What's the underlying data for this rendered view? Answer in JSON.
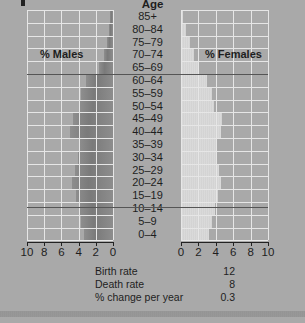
{
  "chart_data": {
    "type": "bar",
    "subtype": "population-pyramid",
    "title": "Age",
    "categories": [
      "85+",
      "80–84",
      "75–79",
      "70–74",
      "65–69",
      "60–64",
      "55–59",
      "50–54",
      "45–49",
      "40–44",
      "35–39",
      "30–34",
      "25–29",
      "20–24",
      "15–19",
      "10–14",
      "5–9",
      "0–4"
    ],
    "series": [
      {
        "name": "% Males",
        "values": [
          0.35,
          0.5,
          0.7,
          1.0,
          1.6,
          3.1,
          3.7,
          3.8,
          4.7,
          5.0,
          4.0,
          4.1,
          4.4,
          4.8,
          4.3,
          4.0,
          3.7,
          3.4
        ]
      },
      {
        "name": "% Females",
        "values": [
          0.25,
          0.6,
          1.0,
          1.5,
          2.1,
          3.0,
          3.6,
          3.8,
          4.7,
          4.6,
          4.1,
          4.1,
          4.4,
          4.6,
          4.2,
          3.9,
          3.6,
          3.2
        ]
      }
    ],
    "xlabel_left": "% Males",
    "xlabel_right": "% Females",
    "ylabel": "Age",
    "xlim": [
      0,
      10
    ],
    "xticks_left": [
      "10",
      "8",
      "6",
      "4",
      "2",
      "0"
    ],
    "xticks_right": [
      "0",
      "2",
      "4",
      "6",
      "8",
      "10"
    ],
    "grid": true,
    "reference_lines_between": [
      [
        "65–69",
        "60–64"
      ],
      [
        "15–19",
        "10–14"
      ]
    ],
    "annotations": [
      {
        "label": "Birth rate",
        "value": "12"
      },
      {
        "label": "Death rate",
        "value": "8"
      },
      {
        "label": "% change per year",
        "value": "0.3"
      }
    ]
  },
  "labels": {
    "age_title": "Age",
    "males": "% Males",
    "females": "% Females"
  },
  "stats": [
    {
      "label": "Birth rate",
      "value": "12"
    },
    {
      "label": "Death rate",
      "value": "8"
    },
    {
      "label": "% change per year",
      "value": "0.3"
    }
  ]
}
